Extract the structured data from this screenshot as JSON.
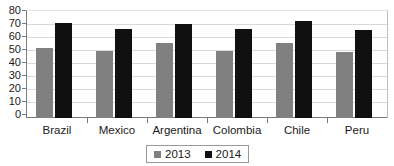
{
  "chart_data": {
    "type": "bar",
    "title": "",
    "subtitle": "",
    "xlabel": "",
    "ylabel": "",
    "categories": [
      "Brazil",
      "Mexico",
      "Argentina",
      "Colombia",
      "Chile",
      "Peru"
    ],
    "series": [
      {
        "name": "2013",
        "color": "#808080",
        "values": [
          52,
          50,
          56,
          50,
          56,
          49.5
        ]
      },
      {
        "name": "2014",
        "color": "#101010",
        "values": [
          71,
          66.5,
          70,
          66.5,
          72.5,
          65.5
        ]
      }
    ],
    "ylim": [
      0,
      80
    ],
    "ytick_labels": [
      "80",
      "70",
      "60",
      "50",
      "40",
      "30",
      "20",
      "10",
      "0"
    ],
    "ytick_values": [
      80,
      70,
      60,
      50,
      40,
      30,
      20,
      10,
      0
    ],
    "grid": true,
    "grid_axis": "y",
    "legend": {
      "position": "bottom",
      "entries": [
        "2013",
        "2014"
      ]
    },
    "annotations": []
  }
}
